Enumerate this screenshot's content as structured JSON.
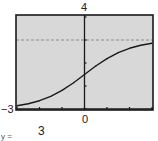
{
  "chart_data": {
    "type": "line",
    "title": "",
    "xlabel": "",
    "ylabel": "",
    "xlim": [
      -3,
      3
    ],
    "ylim": [
      0,
      4
    ],
    "grid": false,
    "x_ticks": [
      -3,
      -2,
      -1,
      0,
      1,
      2,
      3
    ],
    "y_ticks": [
      0,
      1,
      2,
      3,
      4
    ],
    "tick_labels": {
      "ymax": "4",
      "xmin": "−3",
      "xzero": "0"
    },
    "series": [
      {
        "name": "f(x)",
        "x": [
          -3,
          -2.5,
          -2,
          -1.5,
          -1,
          -0.5,
          0,
          0.5,
          1,
          1.5,
          2,
          2.5,
          3
        ],
        "values": [
          0.14,
          0.23,
          0.36,
          0.55,
          0.81,
          1.13,
          1.5,
          1.87,
          2.19,
          2.45,
          2.64,
          2.77,
          2.86
        ]
      }
    ],
    "asymptote": {
      "name": "horizontal-asymptote",
      "y": 3,
      "style": "dashed"
    },
    "caption": "3",
    "caption_prefix": "y ="
  },
  "colors": {
    "plot_background": "#d8d8d8",
    "frame": "#1a1a1a",
    "curve": "#1a1a1a",
    "axis": "#1a1a1a",
    "asymptote": "#8a8a8a"
  }
}
